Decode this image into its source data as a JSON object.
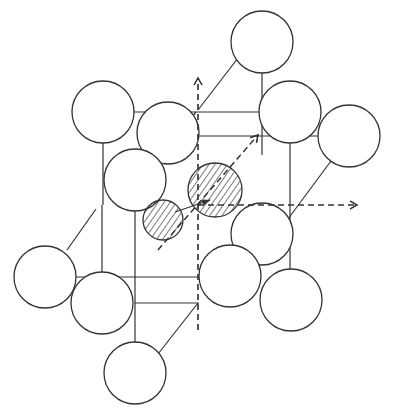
{
  "diagram": {
    "title": "",
    "type": "crystal-lattice-interstitial",
    "colors": {
      "stroke": "#333333",
      "background": "#ffffff",
      "hatch": "#333333"
    },
    "lattice_atoms": [
      {
        "id": "top",
        "cx": 262,
        "cy": 42,
        "r": 31
      },
      {
        "id": "upper-left",
        "cx": 103,
        "cy": 112,
        "r": 31
      },
      {
        "id": "upper-mid",
        "cx": 168,
        "cy": 133,
        "r": 31
      },
      {
        "id": "upper-right",
        "cx": 290,
        "cy": 112,
        "r": 31
      },
      {
        "id": "far-right",
        "cx": 349,
        "cy": 136,
        "r": 31
      },
      {
        "id": "front-upper",
        "cx": 135,
        "cy": 180,
        "r": 31
      },
      {
        "id": "center-right",
        "cx": 262,
        "cy": 234,
        "r": 31
      },
      {
        "id": "left",
        "cx": 45,
        "cy": 277,
        "r": 31
      },
      {
        "id": "front-lower",
        "cx": 230,
        "cy": 276,
        "r": 31
      },
      {
        "id": "lower-left",
        "cx": 102,
        "cy": 303,
        "r": 31
      },
      {
        "id": "lower-right",
        "cx": 291,
        "cy": 300,
        "r": 31
      },
      {
        "id": "bottom",
        "cx": 135,
        "cy": 373,
        "r": 31
      }
    ],
    "interstitial_atoms": [
      {
        "id": "large-interstitial",
        "cx": 215,
        "cy": 190,
        "r": 27
      },
      {
        "id": "small-interstitial",
        "cx": 163,
        "cy": 220,
        "r": 20
      }
    ],
    "solid_lines": [
      {
        "x1": 125,
        "y1": 112,
        "x2": 259,
        "y2": 112
      },
      {
        "x1": 195,
        "y1": 136,
        "x2": 318,
        "y2": 136
      },
      {
        "x1": 262,
        "y1": 73,
        "x2": 262,
        "y2": 155
      },
      {
        "x1": 290,
        "y1": 143,
        "x2": 290,
        "y2": 281
      },
      {
        "x1": 103,
        "y1": 143,
        "x2": 103,
        "y2": 205
      },
      {
        "x1": 135,
        "y1": 211,
        "x2": 135,
        "y2": 353
      },
      {
        "x1": 238,
        "y1": 58,
        "x2": 198,
        "y2": 110
      },
      {
        "x1": 196,
        "y1": 112,
        "x2": 157,
        "y2": 160
      },
      {
        "x1": 331,
        "y1": 161,
        "x2": 265,
        "y2": 250
      },
      {
        "x1": 230,
        "y1": 245,
        "x2": 210,
        "y2": 268
      },
      {
        "x1": 43,
        "y1": 277,
        "x2": 199,
        "y2": 277
      },
      {
        "x1": 135,
        "y1": 303,
        "x2": 199,
        "y2": 303
      },
      {
        "x1": 261,
        "y1": 300,
        "x2": 260,
        "y2": 300
      },
      {
        "x1": 102,
        "y1": 205,
        "x2": 102,
        "y2": 280
      },
      {
        "x1": 67,
        "y1": 250,
        "x2": 96,
        "y2": 209
      },
      {
        "x1": 198,
        "y1": 303,
        "x2": 158,
        "y2": 354
      },
      {
        "x1": 262,
        "y1": 203,
        "x2": 262,
        "y2": 230
      },
      {
        "x1": 290,
        "y1": 269,
        "x2": 290,
        "y2": 285
      },
      {
        "x1": 321,
        "y1": 136,
        "x2": 318,
        "y2": 136
      }
    ],
    "dashed_arrows": [
      {
        "id": "z-axis",
        "x1": 198,
        "y1": 330,
        "x2": 198,
        "y2": 78
      },
      {
        "id": "x-axis",
        "x1": 198,
        "y1": 205,
        "x2": 357,
        "y2": 205
      },
      {
        "id": "diagonal-axis",
        "x1": 158,
        "y1": 250,
        "x2": 258,
        "y2": 135
      }
    ],
    "solid_arrows": [
      {
        "id": "displacement-arrow",
        "x1": 175,
        "y1": 212,
        "x2": 210,
        "y2": 200
      }
    ]
  }
}
